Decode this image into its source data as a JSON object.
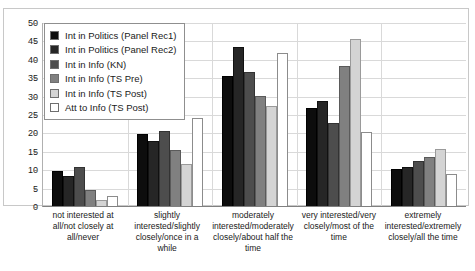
{
  "chart_data": {
    "type": "bar",
    "title": "",
    "subtitle": "",
    "xlabel": "",
    "ylabel": "",
    "ylim": [
      0,
      50
    ],
    "ytick_step": 5,
    "yticks": [
      0,
      5,
      10,
      15,
      20,
      25,
      30,
      35,
      40,
      45,
      50
    ],
    "grid": true,
    "legend_position": "top-left",
    "grouped": true,
    "categories": [
      "not interested at all/not closely at all/never",
      "slightly interested/slightly closely/once in a while",
      "moderately interested/moderately closely/about half the time",
      "very interested/very closely/most of the time",
      "extremely interested/extremely closely/all the time"
    ],
    "series": [
      {
        "name": "Int in Politics (Panel Rec1)",
        "color": "#0d0d0d",
        "values": [
          9.6,
          19.5,
          35.2,
          26.5,
          10.1
        ]
      },
      {
        "name": "Int in Politics (Panel Rec2)",
        "color": "#262626",
        "values": [
          8.2,
          17.8,
          43.3,
          28.5,
          10.6
        ]
      },
      {
        "name": "Int in Info (KN)",
        "color": "#4d4d4d",
        "values": [
          10.6,
          20.3,
          36.3,
          22.5,
          12.2
        ]
      },
      {
        "name": "Int in Info (TS Pre)",
        "color": "#808080",
        "values": [
          4.4,
          15.3,
          30.0,
          38.0,
          13.3
        ]
      },
      {
        "name": "Int in Info (TS Post)",
        "color": "#d4d4d4",
        "values": [
          1.5,
          11.4,
          27.3,
          45.5,
          15.4
        ]
      },
      {
        "name": "Att to Info (TS Post)",
        "color": "#ffffff",
        "values": [
          2.6,
          23.8,
          41.5,
          20.0,
          8.6
        ]
      }
    ]
  }
}
